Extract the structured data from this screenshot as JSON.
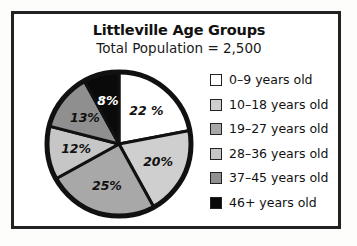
{
  "page": {
    "background_color": "#fdfdfc",
    "frame_border_color": "#222222"
  },
  "header": {
    "title": "Littleville Age Groups",
    "subtitle": "Total Population  =  2,500"
  },
  "legend": {
    "items": [
      {
        "label": "0–9 years old",
        "color": "#ffffff",
        "percent": 22
      },
      {
        "label": "10–18 years old",
        "color": "#cfcfcf",
        "percent": 20
      },
      {
        "label": "19–27 years old",
        "color": "#a8a8a8",
        "percent": 25
      },
      {
        "label": "28–36 years old",
        "color": "#c6c6c6",
        "percent": 12
      },
      {
        "label": "37–45 years old",
        "color": "#8f8f8f",
        "percent": 13
      },
      {
        "label": "46+  years old",
        "color": "#0a0a0a",
        "percent": 8
      }
    ]
  },
  "chart_data": {
    "type": "pie",
    "title": "Littleville Age Groups",
    "subtitle": "Total Population  =  2,500",
    "total_population": 2500,
    "categories": [
      "0–9 years old",
      "10–18 years old",
      "19–27 years old",
      "28–36 years old",
      "37–45 years old",
      "46+  years old"
    ],
    "values": [
      22,
      20,
      25,
      12,
      13,
      8
    ],
    "unit": "percent",
    "slice_labels": [
      "22 %",
      "20%",
      "25%",
      "12%",
      "13%",
      "8%"
    ],
    "slice_colors": [
      "#ffffff",
      "#cfcfcf",
      "#a8a8a8",
      "#c6c6c6",
      "#8f8f8f",
      "#0a0a0a"
    ],
    "slice_label_colors": [
      "dark",
      "dark",
      "dark",
      "dark",
      "dark",
      "light"
    ],
    "start_angle_deg": 0,
    "direction": "clockwise",
    "legend_position": "right",
    "grid": false,
    "stroke_color": "#111111",
    "outline_color": "#111111"
  }
}
